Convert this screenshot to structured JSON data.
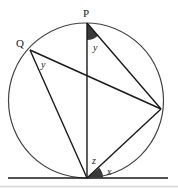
{
  "diagram": {
    "type": "circle-geometry",
    "points": {
      "P": {
        "label": "P",
        "x": 87,
        "y": 23
      },
      "Q": {
        "label": "Q",
        "x": 30,
        "y": 50
      },
      "R": {
        "label": "",
        "x": 161,
        "y": 109
      },
      "T": {
        "label": "",
        "x": 87,
        "y": 178
      }
    },
    "circle": {
      "cx": 86,
      "cy": 100.5,
      "r": 77.5
    },
    "tangent": {
      "x1": 8,
      "x2": 168,
      "y": 178
    },
    "angles": [
      {
        "name": "angle-at-P",
        "label": "y",
        "shaded": true
      },
      {
        "name": "angle-at-Q",
        "label": "y",
        "shaded": false
      },
      {
        "name": "angle-at-T-z",
        "label": "z",
        "shaded": false
      },
      {
        "name": "angle-at-T-x",
        "label": "x",
        "shaded": true
      }
    ],
    "colors": {
      "stroke": "#1a1a1a",
      "shade": "#3a3a3a",
      "baseline": "#cfcfcf"
    }
  }
}
